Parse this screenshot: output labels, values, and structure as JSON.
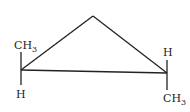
{
  "diagram": {
    "colors": {
      "bond": "#222222",
      "text": "#222222",
      "background": "#ffffff"
    },
    "left_carbon": {
      "top_label": "CH",
      "top_subscript": "3",
      "bottom_label": "H"
    },
    "right_carbon": {
      "top_label": "H",
      "bottom_label": "CH",
      "bottom_subscript": "3"
    }
  }
}
